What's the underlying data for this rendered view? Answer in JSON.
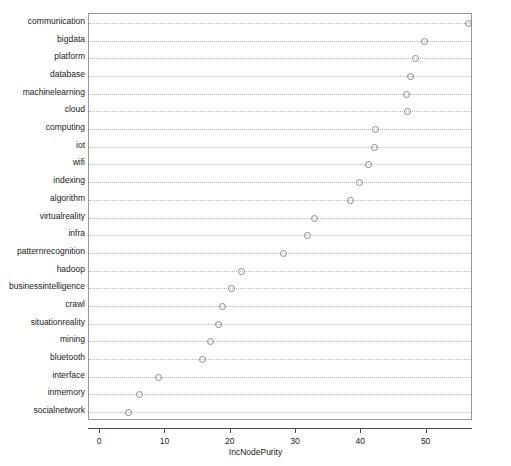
{
  "chart_data": {
    "type": "scatter",
    "title": "",
    "subtitle": "",
    "xlabel": "IncNodePurity",
    "ylabel": "",
    "xlim": [
      -1.7,
      57.1
    ],
    "xticks": [
      0,
      10,
      20,
      30,
      40,
      50
    ],
    "xticklabels": [
      "0",
      "10",
      "20",
      "30",
      "40",
      "50"
    ],
    "grid": "dotted-horizontal",
    "legend": "none",
    "marker": "open-circle",
    "categories": [
      "communication",
      "bigdata",
      "platform",
      "database",
      "machinelearning",
      "cloud",
      "computing",
      "iot",
      "wifi",
      "indexing",
      "algorithm",
      "virtualreality",
      "infra",
      "patternrecognition",
      "hadoop",
      "businessintelligence",
      "crawl",
      "situationreality",
      "mining",
      "bluetooth",
      "interface",
      "inmemory",
      "socialnetwork"
    ],
    "values": [
      56.3,
      49.6,
      48.2,
      47.5,
      46.9,
      47.0,
      42.1,
      42.0,
      41.0,
      39.7,
      38.3,
      32.7,
      31.7,
      28.0,
      21.5,
      20.1,
      18.7,
      18.0,
      16.8,
      15.6,
      8.9,
      5.9,
      4.3
    ],
    "series": [
      {
        "name": "IncNodePurity",
        "values": [
          56.3,
          49.6,
          48.2,
          47.5,
          46.9,
          47.0,
          42.1,
          42.0,
          41.0,
          39.7,
          38.3,
          32.7,
          31.7,
          28.0,
          21.5,
          20.1,
          18.7,
          18.0,
          16.8,
          15.6,
          8.9,
          5.9,
          4.3
        ]
      }
    ],
    "colors": {
      "marker_stroke": "#8a8a8a",
      "panel_border": "#9a9a9a",
      "grid_line": "#b9b9b9",
      "axis": "#4d4d4d",
      "text": "#1a1a1a",
      "background": "#ffffff"
    }
  }
}
